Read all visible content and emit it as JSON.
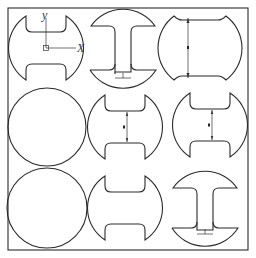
{
  "figure": {
    "frame": {
      "x": 8,
      "y": 8,
      "width": 240,
      "height": 242
    },
    "axes_labels": {
      "y": "y",
      "x": "X"
    },
    "stroke_color": "#2a2a2a",
    "background": "#ffffff"
  },
  "cells": [
    {
      "row": 0,
      "col": 0,
      "shape": "notched-circle-horizontal",
      "annotation": "centroid-axes"
    },
    {
      "row": 0,
      "col": 1,
      "shape": "I-section-circle",
      "annotation": "web-thickness-dimension"
    },
    {
      "row": 0,
      "col": 2,
      "shape": "truncated-circle-vertical",
      "annotation": "height-dimension"
    },
    {
      "row": 1,
      "col": 0,
      "shape": "circle",
      "annotation": ""
    },
    {
      "row": 1,
      "col": 1,
      "shape": "notched-circle-horizontal",
      "annotation": "gap-dimension"
    },
    {
      "row": 1,
      "col": 2,
      "shape": "notched-circle-horizontal",
      "annotation": "gap-dimension"
    },
    {
      "row": 2,
      "col": 0,
      "shape": "circle",
      "annotation": ""
    },
    {
      "row": 2,
      "col": 1,
      "shape": "notched-circle-horizontal",
      "annotation": ""
    },
    {
      "row": 2,
      "col": 2,
      "shape": "I-section-circle",
      "annotation": "web-thickness-dimension"
    }
  ]
}
